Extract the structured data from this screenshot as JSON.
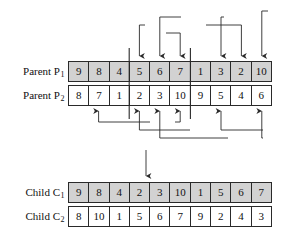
{
  "figure": {
    "type": "crossover-diagram"
  },
  "rows": [
    {
      "id": "parent-1",
      "label_text": "Parent P",
      "label_sub": "1",
      "shaded": true,
      "values": [
        9,
        8,
        4,
        5,
        6,
        7,
        1,
        3,
        2,
        10
      ]
    },
    {
      "id": "parent-2",
      "label_text": "Parent P",
      "label_sub": "2",
      "shaded": false,
      "values": [
        8,
        7,
        1,
        2,
        3,
        10,
        9,
        5,
        4,
        6
      ]
    },
    {
      "id": "child-1",
      "label_text": "Child C",
      "label_sub": "1",
      "shaded": true,
      "values": [
        9,
        8,
        4,
        2,
        3,
        10,
        1,
        5,
        6,
        7
      ]
    },
    {
      "id": "child-2",
      "label_text": "Child C",
      "label_sub": "2",
      "shaded": false,
      "values": [
        8,
        10,
        1,
        5,
        6,
        7,
        9,
        2,
        4,
        3
      ]
    }
  ],
  "cut_points": [
    3,
    6
  ],
  "upper_arrow_targets": [
    4,
    5,
    6,
    8,
    9,
    10
  ],
  "lower_arrow_targets": [
    2,
    4,
    5,
    6,
    8,
    10
  ],
  "colors": {
    "shade": "#d2d2d2",
    "line": "#2a2a2a",
    "text": "#111111",
    "background": "#ffffff"
  }
}
